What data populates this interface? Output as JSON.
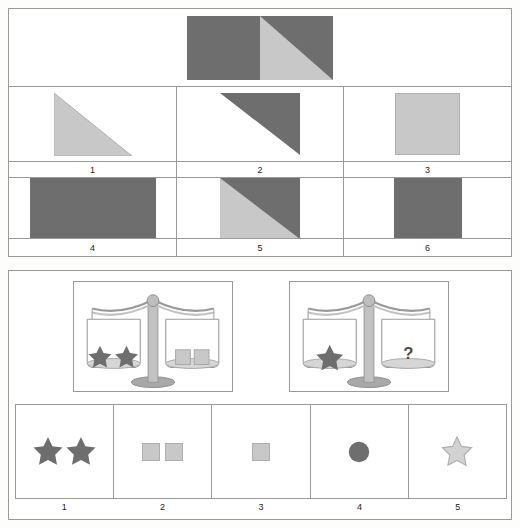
{
  "colors": {
    "dark_gray": "#6e6e6e",
    "light_gray": "#c8c8c8",
    "outline": "#9a9a9a",
    "scale_metal": "#b4b4b4",
    "scale_line": "#8f8f8f",
    "page_bg": "#fdfdfc",
    "text": "#1c1c1c"
  },
  "puzzle_shapes": {
    "name": "shape-matrix-puzzle",
    "stem": {
      "description": "rectangle; left half solid dark gray, right half split diagonally with light lower-left triangle and dark upper-right triangle",
      "shape_id": "stem-rectangle-half-dark-half-diagonal"
    },
    "options": [
      {
        "number": "1",
        "shape_id": "light-right-triangle-hyp-tl-br",
        "description": "light gray right triangle, vertical left edge, horizontal bottom edge"
      },
      {
        "number": "2",
        "shape_id": "dark-right-triangle-hyp-tl-br",
        "description": "dark gray right triangle, horizontal top edge, vertical right edge"
      },
      {
        "number": "3",
        "shape_id": "light-square",
        "description": "light gray square"
      },
      {
        "number": "4",
        "shape_id": "dark-rectangle",
        "description": "dark gray wide rectangle"
      },
      {
        "number": "5",
        "shape_id": "square-split-diagonal-light-dark",
        "description": "square split diagonally, light gray lower-left, dark gray upper-right"
      },
      {
        "number": "6",
        "shape_id": "dark-square",
        "description": "dark gray square"
      }
    ]
  },
  "puzzle_balance": {
    "name": "balance-scale-puzzle",
    "scales": [
      {
        "id": "scale-example",
        "left_pan": {
          "items": "two-dark-stars",
          "count": 2
        },
        "right_pan": {
          "items": "two-light-squares",
          "count": 2
        }
      },
      {
        "id": "scale-question",
        "left_pan": {
          "items": "one-dark-star",
          "count": 1
        },
        "right_pan": {
          "items": "question-mark",
          "label": "?"
        }
      }
    ],
    "options": [
      {
        "number": "1",
        "shape_id": "two-dark-stars",
        "description": "two dark gray stars"
      },
      {
        "number": "2",
        "shape_id": "two-light-squares",
        "description": "two light gray squares"
      },
      {
        "number": "3",
        "shape_id": "one-light-square",
        "description": "one light gray square"
      },
      {
        "number": "4",
        "shape_id": "dark-circle",
        "description": "one dark gray circle"
      },
      {
        "number": "5",
        "shape_id": "light-star",
        "description": "one light gray outlined star"
      }
    ]
  }
}
